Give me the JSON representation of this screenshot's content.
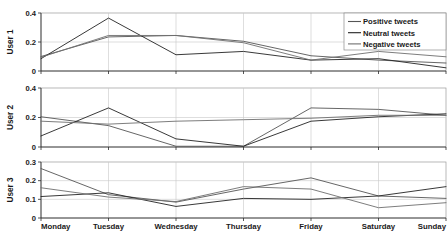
{
  "chart_data": {
    "type": "line",
    "title": "",
    "xlabel": "",
    "categories": [
      "Monday",
      "Tuesday",
      "Wednesday",
      "Thursday",
      "Friday",
      "Saturday",
      "Sunday"
    ],
    "grid": true,
    "legend_position": "top-right",
    "legend": [
      "Positive tweets",
      "Neutral tweets",
      "Negative tweets"
    ],
    "colors": {
      "positive": "#555555",
      "neutral": "#222222",
      "negative": "#6e6e6e"
    },
    "panels": [
      {
        "ylabel": "User 1",
        "ylim": [
          0,
          0.4
        ],
        "yticks": [
          0,
          0.2,
          0.4
        ],
        "ytick_labels": [
          "0",
          "0.2",
          "0.4"
        ],
        "series": [
          {
            "name": "Positive tweets",
            "values": [
              0.1,
              0.235,
              0.245,
              0.205,
              0.105,
              0.075,
              0.055
            ]
          },
          {
            "name": "Neutral tweets",
            "values": [
              0.085,
              0.365,
              0.112,
              0.135,
              0.075,
              0.085,
              0.022
            ]
          },
          {
            "name": "Negative tweets",
            "values": [
              0.095,
              0.245,
              0.245,
              0.195,
              0.075,
              0.135,
              0.098
            ]
          }
        ]
      },
      {
        "ylabel": "User 2",
        "ylim": [
          0,
          0.4
        ],
        "yticks": [
          0,
          0.2,
          0.4
        ],
        "ytick_labels": [
          "0",
          "0.2",
          "0.4"
        ],
        "series": [
          {
            "name": "Positive tweets",
            "values": [
              0.205,
              0.145,
              0.005,
              0.005,
              0.265,
              0.255,
              0.215
            ]
          },
          {
            "name": "Neutral tweets",
            "values": [
              0.075,
              0.265,
              0.055,
              0.005,
              0.175,
              0.205,
              0.225
            ]
          },
          {
            "name": "Negative tweets",
            "values": [
              0.175,
              0.155,
              0.175,
              0.185,
              0.195,
              0.215,
              0.215
            ]
          }
        ]
      },
      {
        "ylabel": "User 3",
        "ylim": [
          0,
          0.3
        ],
        "yticks": [
          0,
          0.1,
          0.2,
          0.3
        ],
        "ytick_labels": [
          "0",
          "0.1",
          "0.2",
          "0.3"
        ],
        "series": [
          {
            "name": "Positive tweets",
            "values": [
              0.265,
              0.125,
              0.085,
              0.155,
              0.215,
              0.118,
              0.105
            ]
          },
          {
            "name": "Neutral tweets",
            "values": [
              0.115,
              0.135,
              0.062,
              0.105,
              0.1,
              0.118,
              0.168
            ]
          },
          {
            "name": "Negative tweets",
            "values": [
              0.162,
              0.112,
              0.088,
              0.168,
              0.155,
              0.055,
              0.082
            ]
          }
        ]
      }
    ]
  }
}
